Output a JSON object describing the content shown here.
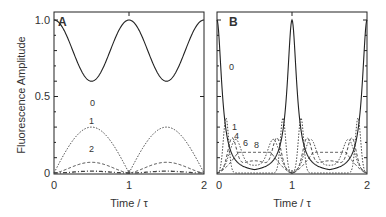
{
  "chart_data": [
    {
      "type": "line",
      "panel_label": "A",
      "xlabel": "Time / τ",
      "ylabel": "Fluorescence Amplitude",
      "xlim": [
        0,
        2
      ],
      "ylim": [
        0,
        1.0
      ],
      "x_ticks": [
        "0",
        "1",
        "2"
      ],
      "y_ticks": [
        "0",
        "0.5",
        "1.0"
      ],
      "series": [
        {
          "name": "0",
          "style": "solid",
          "x": [
            0,
            0.5,
            1,
            1.5,
            2
          ],
          "values": [
            1.0,
            0.6,
            1.0,
            0.6,
            1.0
          ]
        },
        {
          "name": "1",
          "style": "dotted",
          "x": [
            0,
            0.5,
            1,
            1.5,
            2
          ],
          "values": [
            0,
            0.3,
            0,
            0.3,
            0
          ]
        },
        {
          "name": "2",
          "style": "dashed",
          "x": [
            0,
            0.5,
            1,
            1.5,
            2
          ],
          "values": [
            0,
            0.07,
            0,
            0.07,
            0
          ]
        },
        {
          "name": "higher",
          "style": "dash-dot",
          "x": [
            0,
            0.5,
            1,
            1.5,
            2
          ],
          "values": [
            0,
            0.01,
            0,
            0.01,
            0
          ]
        }
      ],
      "annotations": [
        "0",
        "1",
        "2"
      ]
    },
    {
      "type": "line",
      "panel_label": "B",
      "xlabel": "Time / τ",
      "ylabel": "",
      "xlim": [
        0,
        2
      ],
      "ylim": [
        0,
        1.0
      ],
      "x_ticks": [
        "0",
        "1",
        "2"
      ],
      "y_ticks": [],
      "series": [
        {
          "name": "0",
          "style": "solid",
          "x": [
            0,
            0.1,
            0.2,
            0.5,
            0.8,
            0.9,
            1,
            1.1,
            1.2,
            1.5,
            1.8,
            1.9,
            2
          ],
          "values": [
            1.0,
            0.35,
            0.05,
            0,
            0.05,
            0.35,
            1.0,
            0.35,
            0.05,
            0,
            0.05,
            0.35,
            1.0
          ]
        },
        {
          "name": "1",
          "style": "dotted",
          "x": [
            0,
            0.12,
            0.3,
            0.5,
            0.7,
            0.88,
            1,
            1.12,
            1.3,
            1.5,
            1.7,
            1.88,
            2
          ],
          "values": [
            0,
            0.36,
            0.05,
            0,
            0.05,
            0.36,
            0,
            0.36,
            0.05,
            0,
            0.05,
            0.36,
            0
          ]
        },
        {
          "name": "4",
          "style": "dashed",
          "x": [
            0,
            0.2,
            0.4,
            0.6,
            0.8,
            1
          ],
          "values": [
            0,
            0.2,
            0.08,
            0.08,
            0.2,
            0
          ]
        },
        {
          "name": "6",
          "style": "dotted",
          "x": [
            0,
            0.25,
            0.5,
            0.75,
            1
          ],
          "values": [
            0,
            0.17,
            0.06,
            0.17,
            0
          ]
        },
        {
          "name": "8",
          "style": "dashed",
          "x": [
            0,
            0.3,
            0.5,
            0.7,
            1
          ],
          "values": [
            0,
            0.14,
            0.13,
            0.14,
            0
          ]
        }
      ],
      "annotations": [
        "0",
        "1",
        "4",
        "6",
        "8"
      ]
    }
  ],
  "labels": {
    "panel_a": "A",
    "panel_b": "B",
    "ylabel": "Fluorescence Amplitude",
    "xlabel_a": "Time / τ",
    "xlabel_b": "Time / τ",
    "ytick_0": "0",
    "ytick_05": "0.5",
    "ytick_1": "1.0",
    "xtick_a_0": "0",
    "xtick_a_1": "1",
    "xtick_a_2": "2",
    "xtick_b_0": "0",
    "xtick_b_1": "1",
    "xtick_b_2": "2",
    "a_curve_0": "0",
    "a_curve_1": "1",
    "a_curve_2": "2",
    "b_curve_0": "0",
    "b_curve_1": "1",
    "b_curve_4": "4",
    "b_curve_6": "6",
    "b_curve_8": "8"
  }
}
